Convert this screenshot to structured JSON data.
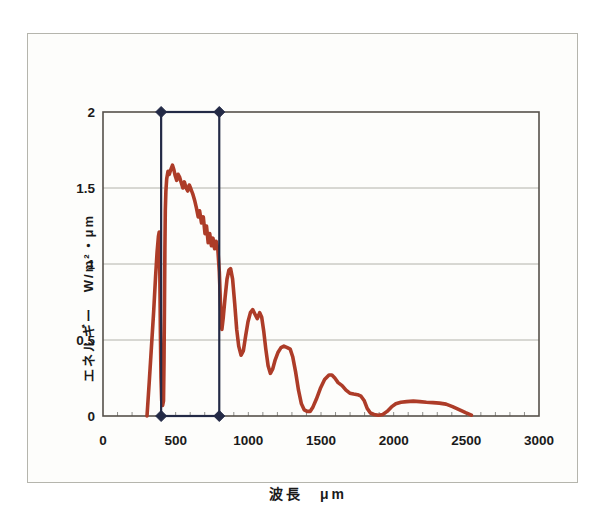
{
  "colors": {
    "paper": "#fdfdfb",
    "frame_border": "#b5b5ad",
    "plot_border": "#55504a",
    "grid": "#b2b2aa",
    "minor_tick": "#6a6a64",
    "text": "#1a1a1a",
    "curve": "#ad3c28",
    "band": "#232a46"
  },
  "chart_data": {
    "type": "line",
    "title": "",
    "xlabel": "波長　μm",
    "ylabel": "エネルギー　W/m²・μm",
    "xlim": [
      0,
      3000
    ],
    "ylim": [
      0,
      2
    ],
    "grid": "horizontal-only",
    "x_minor_tick_step": 100,
    "x_ticks": [
      {
        "v": 0,
        "label": "0"
      },
      {
        "v": 500,
        "label": "500"
      },
      {
        "v": 1000,
        "label": "1000"
      },
      {
        "v": 1500,
        "label": "1500"
      },
      {
        "v": 2000,
        "label": "2000"
      },
      {
        "v": 2500,
        "label": "2500"
      },
      {
        "v": 3000,
        "label": "3000"
      }
    ],
    "y_ticks": [
      {
        "v": 0,
        "label": "0"
      },
      {
        "v": 0.5,
        "label": "0.5"
      },
      {
        "v": 1,
        "label": "1"
      },
      {
        "v": 1.5,
        "label": "1.5"
      },
      {
        "v": 2,
        "label": "2"
      }
    ],
    "visible_band": {
      "x_start": 400,
      "x_end": 800,
      "y_start": 0,
      "y_end": 2,
      "marker": "diamond",
      "color": "#232a46"
    },
    "series": [
      {
        "name": "solar-spectrum",
        "color": "#ad3c28",
        "points": [
          [
            303,
            0
          ],
          [
            318,
            0.22
          ],
          [
            333,
            0.45
          ],
          [
            348,
            0.68
          ],
          [
            362,
            0.92
          ],
          [
            372,
            1.08
          ],
          [
            381,
            1.18
          ],
          [
            387,
            1.21
          ],
          [
            391,
            0.95
          ],
          [
            395,
            0.55
          ],
          [
            399,
            0.25
          ],
          [
            404,
            0.1
          ],
          [
            410,
            0.07
          ],
          [
            416,
            0.1
          ],
          [
            420,
            0.35
          ],
          [
            423,
            0.75
          ],
          [
            426,
            1.1
          ],
          [
            429,
            1.35
          ],
          [
            433,
            1.48
          ],
          [
            438,
            1.56
          ],
          [
            447,
            1.61
          ],
          [
            456,
            1.59
          ],
          [
            466,
            1.62
          ],
          [
            478,
            1.65
          ],
          [
            488,
            1.62
          ],
          [
            497,
            1.58
          ],
          [
            507,
            1.55
          ],
          [
            517,
            1.59
          ],
          [
            528,
            1.57
          ],
          [
            540,
            1.53
          ],
          [
            550,
            1.5
          ],
          [
            560,
            1.54
          ],
          [
            572,
            1.5
          ],
          [
            583,
            1.48
          ],
          [
            594,
            1.52
          ],
          [
            606,
            1.49
          ],
          [
            618,
            1.46
          ],
          [
            630,
            1.42
          ],
          [
            643,
            1.37
          ],
          [
            655,
            1.31
          ],
          [
            665,
            1.35
          ],
          [
            678,
            1.27
          ],
          [
            690,
            1.31
          ],
          [
            702,
            1.2
          ],
          [
            712,
            1.25
          ],
          [
            724,
            1.14
          ],
          [
            734,
            1.2
          ],
          [
            746,
            1.12
          ],
          [
            757,
            1.17
          ],
          [
            768,
            1.1
          ],
          [
            778,
            1.15
          ],
          [
            790,
            1.1
          ],
          [
            800,
            0.95
          ],
          [
            810,
            0.7
          ],
          [
            818,
            0.57
          ],
          [
            828,
            0.65
          ],
          [
            840,
            0.78
          ],
          [
            853,
            0.9
          ],
          [
            866,
            0.96
          ],
          [
            878,
            0.97
          ],
          [
            892,
            0.9
          ],
          [
            906,
            0.74
          ],
          [
            920,
            0.57
          ],
          [
            934,
            0.46
          ],
          [
            950,
            0.4
          ],
          [
            966,
            0.43
          ],
          [
            982,
            0.53
          ],
          [
            998,
            0.62
          ],
          [
            1014,
            0.68
          ],
          [
            1030,
            0.7
          ],
          [
            1046,
            0.67
          ],
          [
            1062,
            0.64
          ],
          [
            1078,
            0.68
          ],
          [
            1092,
            0.65
          ],
          [
            1106,
            0.56
          ],
          [
            1120,
            0.44
          ],
          [
            1136,
            0.33
          ],
          [
            1152,
            0.28
          ],
          [
            1168,
            0.31
          ],
          [
            1185,
            0.37
          ],
          [
            1205,
            0.42
          ],
          [
            1225,
            0.45
          ],
          [
            1245,
            0.46
          ],
          [
            1268,
            0.45
          ],
          [
            1288,
            0.44
          ],
          [
            1305,
            0.39
          ],
          [
            1325,
            0.29
          ],
          [
            1345,
            0.17
          ],
          [
            1365,
            0.08
          ],
          [
            1385,
            0.04
          ],
          [
            1405,
            0.03
          ],
          [
            1425,
            0.03
          ],
          [
            1445,
            0.06
          ],
          [
            1468,
            0.11
          ],
          [
            1495,
            0.18
          ],
          [
            1525,
            0.24
          ],
          [
            1555,
            0.27
          ],
          [
            1575,
            0.27
          ],
          [
            1595,
            0.25
          ],
          [
            1618,
            0.22
          ],
          [
            1645,
            0.2
          ],
          [
            1672,
            0.17
          ],
          [
            1698,
            0.15
          ],
          [
            1725,
            0.145
          ],
          [
            1752,
            0.14
          ],
          [
            1775,
            0.13
          ],
          [
            1798,
            0.1
          ],
          [
            1818,
            0.05
          ],
          [
            1840,
            0.02
          ],
          [
            1865,
            0.01
          ],
          [
            1895,
            0.005
          ],
          [
            1925,
            0.01
          ],
          [
            1955,
            0.03
          ],
          [
            1985,
            0.06
          ],
          [
            2015,
            0.08
          ],
          [
            2050,
            0.09
          ],
          [
            2090,
            0.095
          ],
          [
            2135,
            0.098
          ],
          [
            2180,
            0.095
          ],
          [
            2225,
            0.09
          ],
          [
            2270,
            0.088
          ],
          [
            2315,
            0.085
          ],
          [
            2360,
            0.078
          ],
          [
            2405,
            0.062
          ],
          [
            2450,
            0.042
          ],
          [
            2495,
            0.022
          ],
          [
            2535,
            0.006
          ]
        ]
      }
    ]
  }
}
